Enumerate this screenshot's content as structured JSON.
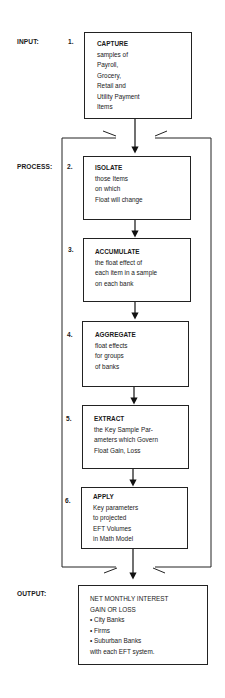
{
  "stages": {
    "input": "INPUT:",
    "process": "PROCESS:",
    "output": "OUTPUT:"
  },
  "steps": [
    {
      "number": "1.",
      "title": "CAPTURE",
      "lines": [
        "samples of",
        "Payroll,",
        "Grocery,",
        "Retail and",
        "Utility Payment",
        "Items"
      ]
    },
    {
      "number": "2.",
      "title": "ISOLATE",
      "lines": [
        "those Items",
        "on which",
        "Float will change"
      ]
    },
    {
      "number": "3.",
      "title": "ACCUMULATE",
      "lines": [
        "the float effect of",
        "each item in a sample",
        "on each bank"
      ]
    },
    {
      "number": "4.",
      "title": "AGGREGATE",
      "lines": [
        "float effects",
        "for groups",
        "of banks"
      ]
    },
    {
      "number": "5.",
      "title": "EXTRACT",
      "lines": [
        "the Key Sample Par-",
        "ameters which Govern",
        "Float Gain, Loss"
      ]
    },
    {
      "number": "6.",
      "title": "APPLY",
      "lines": [
        "Key parameters",
        "to projected",
        "EFT Volumes",
        "in Math Model"
      ]
    }
  ],
  "output_box": {
    "title_line1": "NET MONTHLY INTEREST",
    "title_line2": "GAIN OR LOSS",
    "bullets": [
      "City Banks",
      "Firms",
      "Suburban Banks"
    ],
    "footer": "with each EFT system."
  }
}
